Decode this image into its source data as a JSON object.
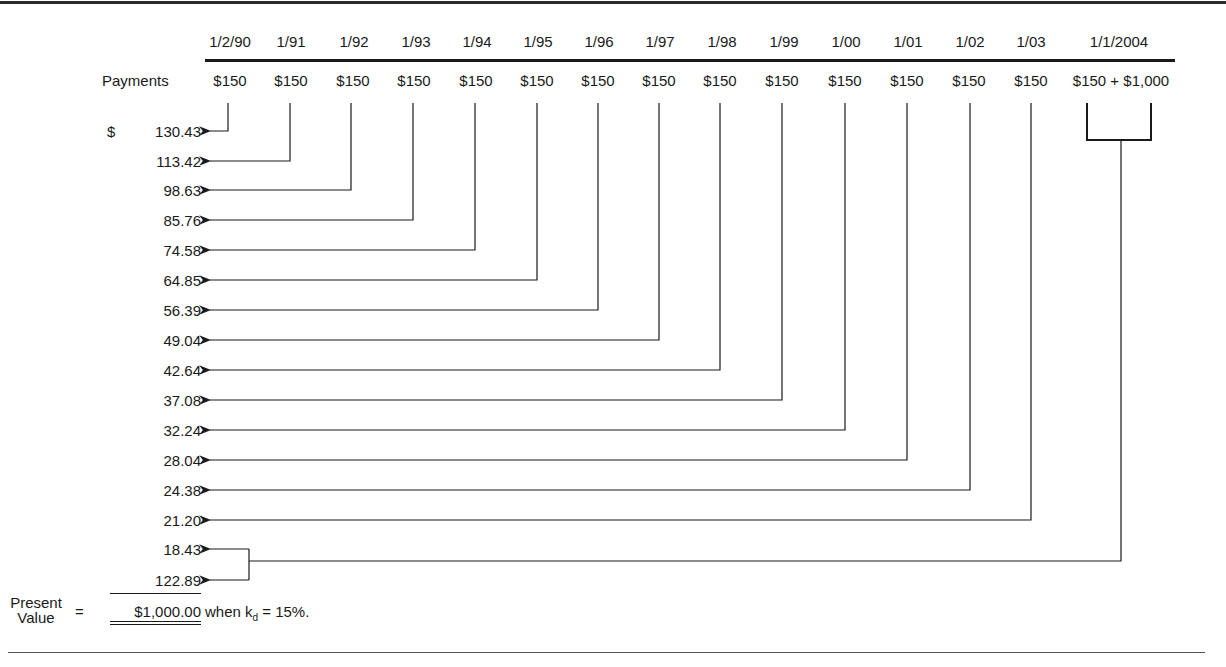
{
  "diagram": {
    "timeline": {
      "dates": [
        "1/2/90",
        "1/91",
        "1/92",
        "1/93",
        "1/94",
        "1/95",
        "1/96",
        "1/97",
        "1/98",
        "1/99",
        "1/00",
        "1/01",
        "1/02",
        "1/03",
        "1/1/2004"
      ],
      "payments_label": "Payments",
      "payments": [
        "$150",
        "$150",
        "$150",
        "$150",
        "$150",
        "$150",
        "$150",
        "$150",
        "$150",
        "$150",
        "$150",
        "$150",
        "$150",
        "$150",
        "$150 + $1,000"
      ]
    },
    "present_values": {
      "currency_symbol": "$",
      "values": [
        "130.43",
        "113.42",
        "98.63",
        "85.76",
        "74.58",
        "64.85",
        "56.39",
        "49.04",
        "42.64",
        "37.08",
        "32.24",
        "28.04",
        "24.38",
        "21.20",
        "18.43",
        "122.89"
      ]
    },
    "summary": {
      "label_line1": "Present",
      "label_line2": "Value",
      "equals": "=",
      "total": "$1,000.00",
      "note_prefix": "when k",
      "note_sub": "d",
      "note_suffix": " = 15%."
    }
  }
}
